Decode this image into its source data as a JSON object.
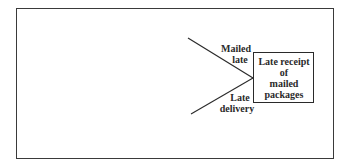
{
  "diagram": {
    "type": "cause-and-effect (fishbone) fragment",
    "effect": {
      "lines": [
        "Late receipt",
        "of",
        "mailed",
        "packages"
      ]
    },
    "causes": [
      {
        "lines": [
          "Mailed",
          "late"
        ],
        "position": "upper"
      },
      {
        "lines": [
          "Late",
          "delivery"
        ],
        "position": "lower"
      }
    ],
    "colors": {
      "stroke": "#2a2a2a",
      "background": "#ffffff"
    }
  }
}
